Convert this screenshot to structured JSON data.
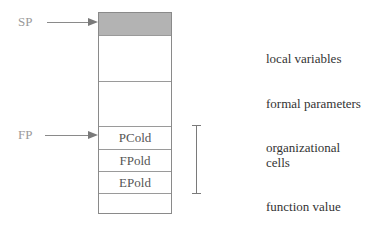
{
  "pointers": {
    "sp": {
      "label": "SP"
    },
    "fp": {
      "label": "FP"
    }
  },
  "stack": {
    "cells": [
      {
        "label": "",
        "role": "top (shaded, pointed by SP)"
      },
      {
        "label": "",
        "role": "local variables"
      },
      {
        "label": "",
        "role": "formal parameters"
      },
      {
        "label": "PCold",
        "role": "organizational cell"
      },
      {
        "label": "FPold",
        "role": "organizational cell"
      },
      {
        "label": "EPold",
        "role": "organizational cell"
      },
      {
        "label": "",
        "role": "function value"
      }
    ]
  },
  "annotations": {
    "local_variables": "local variables",
    "formal_parameters": "formal parameters",
    "organizational_cells_line1": "organizational",
    "organizational_cells_line2": "cells",
    "function_value": "function value"
  },
  "colors": {
    "shaded_cell": "#b3b3b3",
    "border": "#8a8a8a",
    "pointer_text": "#9a9a9a"
  }
}
